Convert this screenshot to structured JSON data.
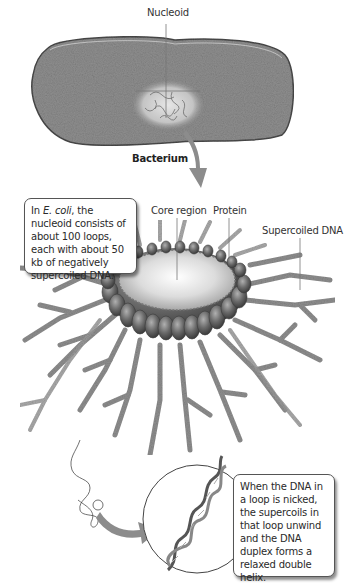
{
  "labels": {
    "nucleoid": "Nucleoid",
    "bacterium": "Bacterium",
    "core_region": "Core region",
    "protein": "Protein",
    "supercoiled_dna": "Supercoiled DNA"
  },
  "callouts": {
    "top": {
      "prefix": "In ",
      "species": "E. coli",
      "rest": ", the nucleoid consists of about 100 loops, each with about 50 kb of negatively supercoiled DNA."
    },
    "bottom": {
      "text": "When the DNA in a loop is nicked, the supercoils in that loop unwind and the DNA duplex forms a relaxed double helix."
    }
  },
  "colors": {
    "cell_fill": "#8a8a8a",
    "arrow": "#8c8c8c",
    "protein": "#6e6e6e",
    "core": "#d9d9d9",
    "dna_loops": "#7a7a7a"
  }
}
